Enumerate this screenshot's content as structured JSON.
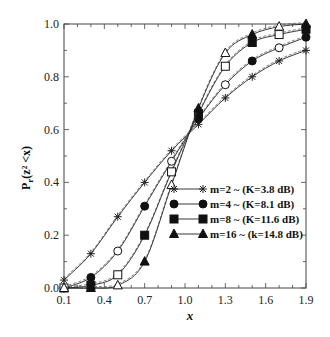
{
  "chart_data": {
    "type": "line",
    "title": "",
    "xlabel": "x",
    "ylabel": "Pr(z² < x)",
    "xlim": [
      0.1,
      1.9
    ],
    "ylim": [
      0.0,
      1.0
    ],
    "grid": false,
    "legend_position": "inside-right-lower",
    "x_ticks": [
      "0.1",
      "0.4",
      "0.7",
      "1.0",
      "1.3",
      "1.6",
      "1.9"
    ],
    "y_ticks": [
      "0.0",
      "0.2",
      "0.4",
      "0.6",
      "0.8",
      "1.0"
    ],
    "x": [
      0.1,
      0.3,
      0.5,
      0.7,
      0.9,
      1.1,
      1.3,
      1.5,
      1.7,
      1.9
    ],
    "series": [
      {
        "name": "m=2 ~ (K=3.8 dB)",
        "marker": "asterisk",
        "values": [
          0.03,
          0.13,
          0.27,
          0.4,
          0.52,
          0.62,
          0.72,
          0.8,
          0.86,
          0.9
        ]
      },
      {
        "name": "m=4 ~ (K=8.1 dB)",
        "marker": "circle",
        "values": [
          0.0,
          0.04,
          0.14,
          0.31,
          0.48,
          0.64,
          0.77,
          0.86,
          0.91,
          0.95
        ]
      },
      {
        "name": "m=8 ~ (K=11.6 dB)",
        "marker": "square",
        "values": [
          0.0,
          0.01,
          0.05,
          0.2,
          0.44,
          0.66,
          0.84,
          0.93,
          0.96,
          0.98
        ]
      },
      {
        "name": "m=16 ~ (k=14.8 dB)",
        "marker": "triangle",
        "values": [
          0.0,
          0.0,
          0.01,
          0.1,
          0.39,
          0.68,
          0.89,
          0.96,
          0.99,
          1.0
        ]
      }
    ]
  },
  "legend": {
    "items": [
      {
        "label": "m=2 ~ (K=3.8 dB)"
      },
      {
        "label": "m=4 ~ (K=8.1 dB)"
      },
      {
        "label": "m=8 ~ (K=11.6 dB)"
      },
      {
        "label": "m=16 ~ (k=14.8 dB)"
      }
    ]
  },
  "axes": {
    "xlabel": "x",
    "ylabel_main": "P",
    "ylabel_sub": "r",
    "ylabel_args": "(z² <x)"
  }
}
